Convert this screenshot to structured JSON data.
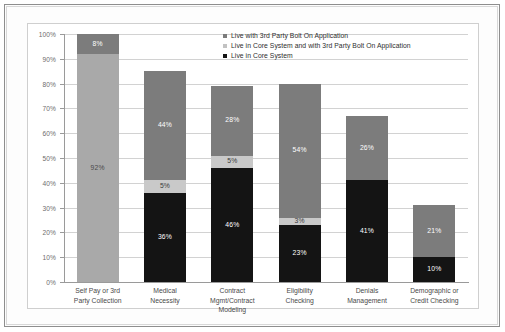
{
  "chart_data": {
    "type": "bar",
    "subtype": "stacked-bar",
    "title": "",
    "xlabel": "",
    "ylabel": "",
    "ylim": [
      0,
      100
    ],
    "ytick_labels": [
      "100%",
      "90%",
      "80%",
      "70%",
      "60%",
      "50%",
      "40%",
      "30%",
      "20%",
      "10%",
      "0%"
    ],
    "ytick_values": [
      100,
      90,
      80,
      70,
      60,
      50,
      40,
      30,
      20,
      10,
      0
    ],
    "grid": true,
    "legend_position": "top-right-inside",
    "categories": [
      "Self Pay or 3rd Party Collection",
      "Medical Necessity",
      "Contract Mgmt/Contract Modeling",
      "Eligibility Checking",
      "Denials Management",
      "Demographic or Credit Checking"
    ],
    "category_lines": [
      [
        "Self Pay or 3rd",
        "Party Collection"
      ],
      [
        "Medical",
        "Necessity"
      ],
      [
        "Contract",
        "Mgmt/Contract",
        "Modeling"
      ],
      [
        "Eligibility",
        "Checking"
      ],
      [
        "Denials",
        "Management"
      ],
      [
        "Demographic or",
        "Credit Checking"
      ]
    ],
    "series": [
      {
        "name": "Live in Core System",
        "color": "#141414",
        "values": [
          0,
          36,
          46,
          23,
          41,
          10
        ],
        "labels": [
          "",
          "36%",
          "46%",
          "23%",
          "41%",
          "10%"
        ]
      },
      {
        "name": "Live in Core System and with 3rd Party Bolt On Application",
        "color": "#c9c9c9",
        "values": [
          92,
          5,
          5,
          3,
          0,
          0
        ],
        "labels": [
          "92%",
          "5%",
          "5%",
          "3%",
          "",
          ""
        ]
      },
      {
        "name": "Live with 3rd Party Bolt On Application",
        "color": "#7c7c7c",
        "values": [
          8,
          44,
          28,
          54,
          26,
          21
        ],
        "labels": [
          "8%",
          "44%",
          "28%",
          "54%",
          "26%",
          "21%"
        ]
      }
    ],
    "totals": [
      100,
      85,
      79,
      80,
      67,
      31
    ]
  },
  "legend": {
    "items": [
      {
        "label": "Live with 3rd Party Bolt On Application",
        "swatch": "bolt"
      },
      {
        "label": "Live in Core System and with 3rd Party Bolt On Application",
        "swatch": "both"
      },
      {
        "label": "Live in Core System",
        "swatch": "core"
      }
    ]
  },
  "colors": {
    "core": "#141414",
    "both": "#c9c9c9",
    "both_wide": "#a9a9a9",
    "bolt": "#7c7c7c",
    "grid": "#d2d2d2",
    "axis": "#9a9a9a",
    "panel_border": "#cfcfcf",
    "frame_border": "#8e8e8e"
  }
}
